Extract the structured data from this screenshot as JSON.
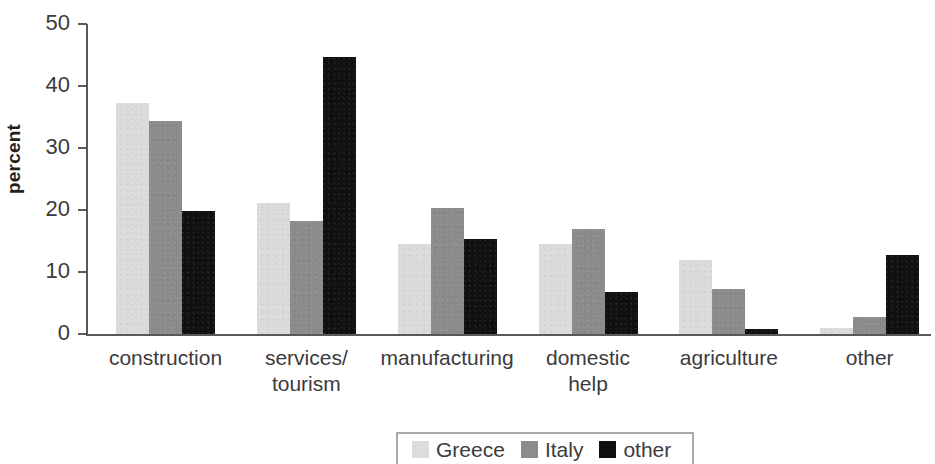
{
  "chart_data": {
    "type": "bar",
    "title": "",
    "subtitle": "",
    "xlabel": "",
    "ylabel": "percent",
    "ylim": [
      0,
      50
    ],
    "yticks": [
      0,
      10,
      20,
      30,
      40,
      50
    ],
    "ytick_labels": [
      "0",
      "10",
      "20",
      "30",
      "40",
      "50"
    ],
    "grid": false,
    "legend_position": "bottom",
    "categories": [
      "construction",
      "services/\ntourism",
      "manufacturing",
      "domestic\nhelp",
      "agriculture",
      "other"
    ],
    "series": [
      {
        "name": "Greece",
        "color": "#dcdcdc",
        "values": [
          37.2,
          21.1,
          14.5,
          14.5,
          12.0,
          1.0
        ]
      },
      {
        "name": "Italy",
        "color": "#8b8b8b",
        "values": [
          34.4,
          18.3,
          20.3,
          17.0,
          7.2,
          2.7
        ]
      },
      {
        "name": "other",
        "color": "#101010",
        "values": [
          19.8,
          44.6,
          15.4,
          6.8,
          0.8,
          12.7
        ]
      }
    ],
    "axis_color": "#58595b",
    "text_color": "#3b3b3d"
  }
}
